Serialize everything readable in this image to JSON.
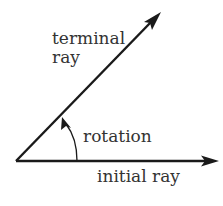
{
  "diagram": {
    "colors": {
      "stroke": "#1a1a1a",
      "text": "#333333",
      "background": "#ffffff"
    },
    "labels": {
      "terminal_line1": "terminal",
      "terminal_line2": "ray",
      "rotation": "rotation",
      "initial": "initial ray"
    },
    "vertex": {
      "x": 16,
      "y": 161
    },
    "initial_ray": {
      "x1": 16,
      "y1": 161,
      "x2": 218,
      "y2": 161
    },
    "terminal_ray": {
      "x1": 16,
      "y1": 161,
      "x2": 160,
      "y2": 13
    }
  }
}
